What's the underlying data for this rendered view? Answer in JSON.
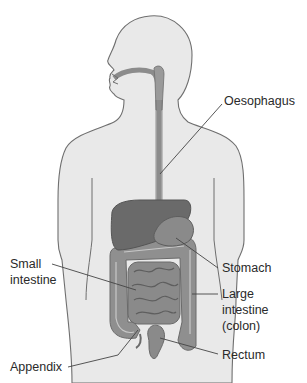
{
  "diagram": {
    "title": "",
    "labels": {
      "oesophagus": "Oesophagus",
      "stomach": "Stomach",
      "small_intestine_line1": "Small",
      "small_intestine_line2": "intestine",
      "large_intestine_line1": "Large",
      "large_intestine_line2": "intestine",
      "large_intestine_line3": "(colon)",
      "rectum": "Rectum",
      "appendix": "Appendix"
    },
    "colors": {
      "body_fill": "#e9e9e9",
      "body_outline": "#6f6f6f",
      "organ_dark": "#6a6a6a",
      "organ_mid": "#8c8c8c",
      "organ_light": "#a9a9a9",
      "leader_line": "#444444",
      "text": "#2a2a2a"
    }
  }
}
